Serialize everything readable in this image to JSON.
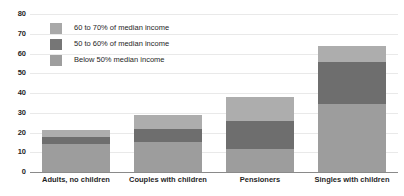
{
  "chart_data": {
    "type": "bar",
    "title": "",
    "xlabel": "",
    "ylabel": "",
    "ylim": [
      0,
      80
    ],
    "ytick_values": [
      0,
      10,
      20,
      30,
      40,
      50,
      60,
      70,
      80
    ],
    "ytick_labels": [
      "0",
      "10",
      "20",
      "30",
      "40",
      "50",
      "60",
      "70",
      "80"
    ],
    "grid": true,
    "stacked": true,
    "legend_position": "upper-left-inside",
    "categories": [
      "Adults, no children",
      "Couples with children",
      "Pensioners",
      "Singles with children"
    ],
    "series": [
      {
        "name": "Below 50% median income",
        "color": "#9d9d9d",
        "values": [
          14,
          15,
          11.5,
          34.5
        ]
      },
      {
        "name": "50 to 60% of median income",
        "color": "#6e6e6e",
        "values": [
          3.5,
          7,
          14.5,
          21
        ]
      },
      {
        "name": "60 to 70% of median income",
        "color": "#adadad",
        "values": [
          4,
          7,
          12,
          8.5
        ]
      }
    ],
    "cumulative_tops": [
      [
        14,
        17.5,
        21.5
      ],
      [
        15,
        22,
        29
      ],
      [
        11.5,
        26,
        38
      ],
      [
        34.5,
        55.5,
        64
      ]
    ],
    "totals": [
      21.5,
      29,
      38,
      64
    ]
  },
  "legend": {
    "items": [
      {
        "label": "60 to 70% of median income",
        "color": "#a8a8a8"
      },
      {
        "label": "50 to 60% of median income",
        "color": "#767676"
      },
      {
        "label": "Below 50% median income",
        "color": "#9e9e9e"
      }
    ]
  },
  "colors": {
    "background": "#ffffff",
    "gridline": "#e9e9e9",
    "axis": "#8a8a8a",
    "text": "#262626"
  }
}
